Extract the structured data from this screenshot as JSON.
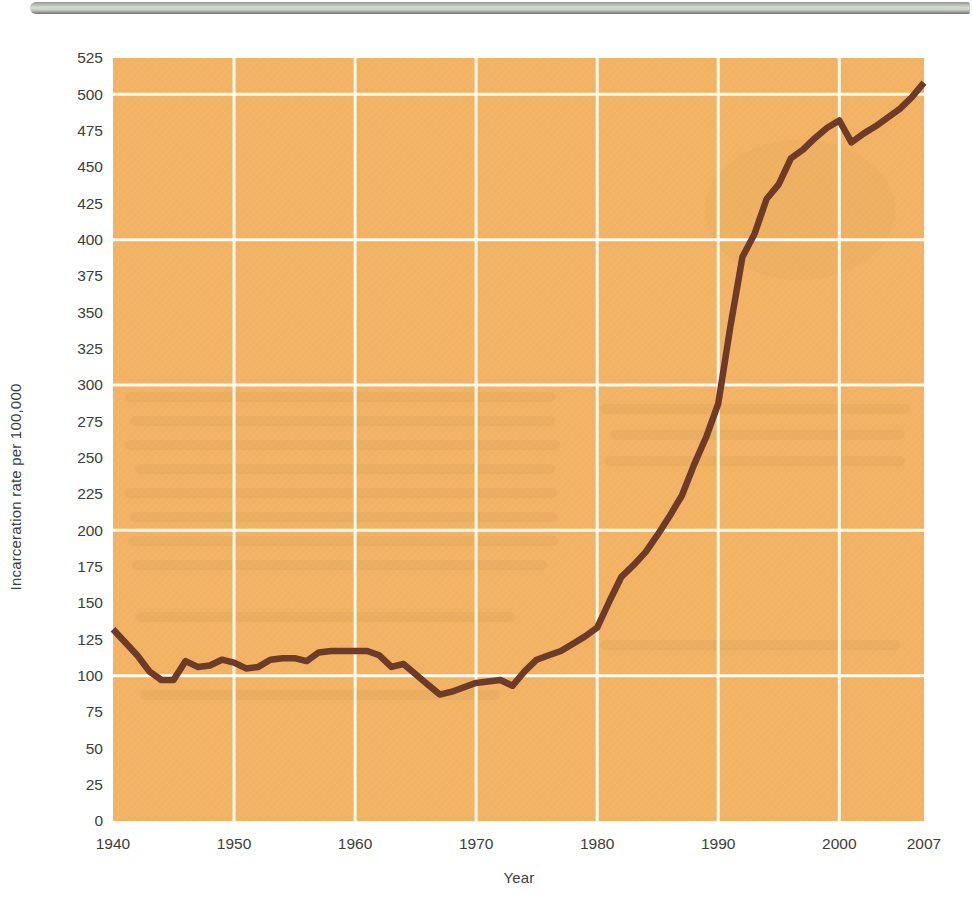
{
  "page": {
    "top_bar": {
      "description": "gray page-edge bar"
    }
  },
  "figure": {
    "y_axis_title": "Incarceration rate per 100,000",
    "x_axis_title": "Year"
  },
  "chart_data": {
    "type": "line",
    "title": "",
    "xlabel": "Year",
    "ylabel": "Incarceration rate per 100,000",
    "xlim": [
      1940,
      2007
    ],
    "ylim": [
      0,
      525
    ],
    "grid": true,
    "legend": "none",
    "y_ticks": [
      525,
      500,
      475,
      450,
      425,
      400,
      375,
      350,
      325,
      300,
      275,
      250,
      225,
      200,
      175,
      150,
      125,
      100,
      75,
      50,
      25,
      0
    ],
    "x_ticks": [
      {
        "label": "1940",
        "value": 1940
      },
      {
        "label": "1950",
        "value": 1950
      },
      {
        "label": "1960",
        "value": 1960
      },
      {
        "label": "1970",
        "value": 1970
      },
      {
        "label": "1980",
        "value": 1980
      },
      {
        "label": "1990",
        "value": 1990
      },
      {
        "label": "2000",
        "value": 2000
      },
      {
        "label": "2007",
        "value": 2007
      }
    ],
    "y_gridlines": [
      100,
      200,
      300,
      400,
      500
    ],
    "x_gridlines": [
      1950,
      1960,
      1970,
      1980,
      1990,
      2000
    ],
    "colors": {
      "plot_background": "#f2b364",
      "gridline": "#fdfaf0",
      "line": "#6e3b28",
      "tick_text": "#3d3d3d"
    },
    "series": [
      {
        "name": "Incarceration rate per 100,000",
        "x": [
          1940,
          1941,
          1942,
          1943,
          1944,
          1945,
          1946,
          1947,
          1948,
          1949,
          1950,
          1951,
          1952,
          1953,
          1954,
          1955,
          1956,
          1957,
          1958,
          1959,
          1960,
          1961,
          1962,
          1963,
          1964,
          1965,
          1966,
          1967,
          1968,
          1969,
          1970,
          1971,
          1972,
          1973,
          1974,
          1975,
          1976,
          1977,
          1978,
          1979,
          1980,
          1981,
          1982,
          1983,
          1984,
          1985,
          1986,
          1987,
          1988,
          1989,
          1990,
          1991,
          1992,
          1993,
          1994,
          1995,
          1996,
          1997,
          1998,
          1999,
          2000,
          2001,
          2002,
          2003,
          2004,
          2005,
          2006,
          2007
        ],
        "values": [
          132,
          123,
          114,
          103,
          97,
          97,
          110,
          106,
          107,
          111,
          109,
          105,
          106,
          111,
          112,
          112,
          110,
          116,
          117,
          117,
          117,
          117,
          114,
          106,
          108,
          101,
          94,
          87,
          89,
          92,
          95,
          96,
          97,
          93,
          103,
          111,
          114,
          117,
          122,
          127,
          133,
          151,
          168,
          176,
          185,
          197,
          210,
          224,
          245,
          264,
          287,
          340,
          388,
          404,
          428,
          438,
          456,
          462,
          470,
          477,
          482,
          467,
          473,
          478,
          484,
          490,
          498,
          508
        ]
      }
    ]
  }
}
